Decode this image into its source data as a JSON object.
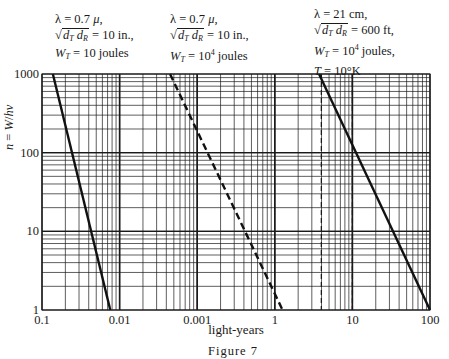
{
  "chart_data": {
    "type": "line",
    "title": "",
    "caption": "Figure 7",
    "xlabel": "light-years",
    "ylabel": "n = W/hν",
    "x_scale": "log",
    "y_scale": "log",
    "x_tick_labels": [
      "0.1",
      "0.01",
      "0.001",
      "1",
      "10",
      "100"
    ],
    "y_tick_labels": [
      "1",
      "10",
      "100",
      "1000"
    ],
    "ylim": [
      1,
      1000
    ],
    "grid": true,
    "legend": null,
    "series": [
      {
        "name": "λ = 0.7 μ, √(dT dR) = 10 in., WT = 10 joules",
        "style": "solid",
        "points_decade_index": [
          [
            0.14,
            3
          ],
          [
            0.88,
            0
          ]
        ]
      },
      {
        "name": "λ = 0.7 μ, √(dT dR) = 10 in., WT = 10^4 joules",
        "style": "dashed",
        "points_decade_index": [
          [
            1.65,
            3
          ],
          [
            3.1,
            0
          ]
        ]
      },
      {
        "name": "λ = 21 cm, √(dT dR) = 600 ft, WT = 10^4 joules, T = 10°K",
        "style": "solid",
        "points_decade_index": [
          [
            3.57,
            3
          ],
          [
            5.0,
            0
          ]
        ]
      }
    ],
    "vertical_dashed_markers_decade_index": [
      3.6,
      4.0
    ],
    "annotations": [
      {
        "lines": [
          "λ = 0.7 μ,",
          "√(dT dR) = 10 in.,",
          "WT = 10 joules"
        ]
      },
      {
        "lines": [
          "λ = 0.7 μ,",
          "√(dT dR) = 10 in.,",
          "WT = 10^4 joules"
        ]
      },
      {
        "lines": [
          "λ = 21 cm,",
          "√(dT dR) = 600 ft,",
          "WT = 10^4 joules,",
          "T = 10°K"
        ]
      }
    ]
  },
  "annot": {
    "a1": {
      "l1": "λ = 0.7 ",
      "mu": "μ",
      "l1b": ",",
      "rad": "d",
      "sT": "T",
      "rad2": " d",
      "sR": "R",
      "eq": " = 10  in.,",
      "w": "W",
      "wsub": "T",
      "weq": " = 10 joules"
    },
    "a2": {
      "l1": "λ = 0.7 ",
      "mu": "μ",
      "l1b": ",",
      "rad": "d",
      "sT": "T",
      "rad2": " d",
      "sR": "R",
      "eq": " = 10  in.,",
      "w": "W",
      "wsub": "T",
      "weq": " = 10",
      "sup": "4",
      "wend": " joules"
    },
    "a3": {
      "l1": "λ = 21 cm,",
      "rad": "d",
      "sT": "T",
      "rad2": " d",
      "sR": "R",
      "eq": " = 600 ft,",
      "w": "W",
      "wsub": "T",
      "weq": " = 10",
      "sup": "4",
      "wend": " joules,",
      "t": "T",
      "teq": " = 10°K"
    }
  },
  "ylabel_text": {
    "n": "n",
    "eq": " = ",
    "w": "W",
    "slash": "/",
    "h": "h",
    "nu": "ν"
  }
}
